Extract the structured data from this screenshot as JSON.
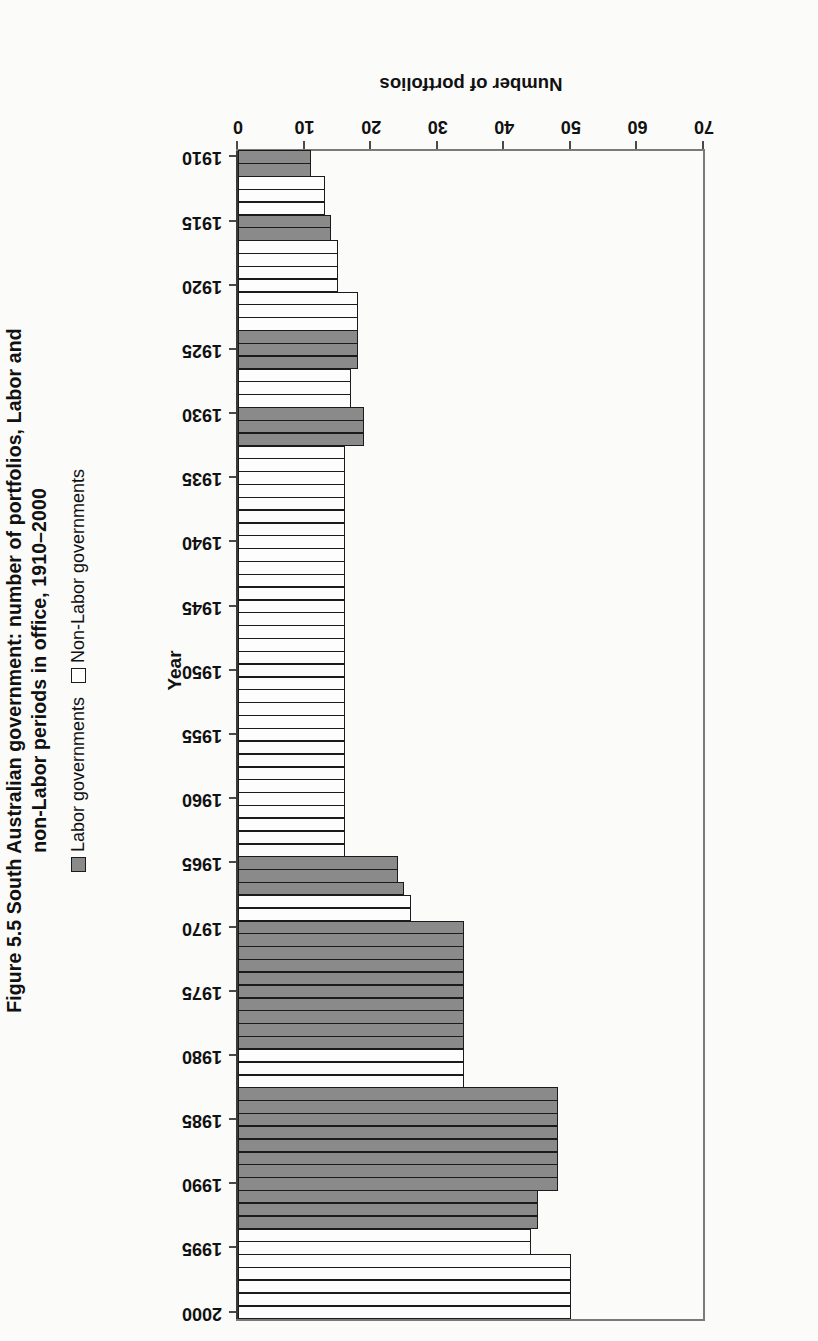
{
  "figure": {
    "title_line1": "Figure 5.5  South Australian government: number of portfolios, Labor and",
    "title_line2": "non-Labor periods in office, 1910–2000",
    "title_full": "Figure 5.5  South Australian government: number of portfolios, Labor and\nnon-Labor periods in office, 1910–2000"
  },
  "legend": {
    "position": "bottom",
    "items": [
      {
        "label": "Labor governments",
        "color": "#8a8a8a",
        "key": "labor"
      },
      {
        "label": "Non-Labor governments",
        "color": "#ffffff",
        "key": "nonlabor"
      }
    ]
  },
  "axes": {
    "category_title": "Year",
    "value_title": "Number of portfolios",
    "value_ticks": [
      "0",
      "10",
      "20",
      "30",
      "40",
      "50",
      "60",
      "70"
    ],
    "category_ticks": [
      "1910",
      "1915",
      "1920",
      "1925",
      "1930",
      "1935",
      "1940",
      "1945",
      "1950",
      "1955",
      "1960",
      "1965",
      "1970",
      "1975",
      "1980",
      "1985",
      "1990",
      "1995",
      "2000"
    ]
  },
  "chart_data": {
    "type": "bar",
    "orientation": "horizontal",
    "xlabel": "Number of portfolios",
    "ylabel": "Year",
    "xlim": [
      0,
      70
    ],
    "xticks": [
      0,
      10,
      20,
      30,
      40,
      50,
      60,
      70
    ],
    "grid": false,
    "legend_position": "bottom",
    "series": [
      {
        "name": "Labor governments",
        "color": "#8a8a8a"
      },
      {
        "name": "Non-Labor governments",
        "color": "#ffffff"
      }
    ],
    "categories": [
      1910,
      1911,
      1912,
      1913,
      1914,
      1915,
      1916,
      1917,
      1918,
      1919,
      1920,
      1921,
      1922,
      1923,
      1924,
      1925,
      1926,
      1927,
      1928,
      1929,
      1930,
      1931,
      1932,
      1933,
      1934,
      1935,
      1936,
      1937,
      1938,
      1939,
      1940,
      1941,
      1942,
      1943,
      1944,
      1945,
      1946,
      1947,
      1948,
      1949,
      1950,
      1951,
      1952,
      1953,
      1954,
      1955,
      1956,
      1957,
      1958,
      1959,
      1960,
      1961,
      1962,
      1963,
      1964,
      1965,
      1966,
      1967,
      1968,
      1969,
      1970,
      1971,
      1972,
      1973,
      1974,
      1975,
      1976,
      1977,
      1978,
      1979,
      1980,
      1981,
      1982,
      1983,
      1984,
      1985,
      1986,
      1987,
      1988,
      1989,
      1990,
      1991,
      1992,
      1993,
      1994,
      1995,
      1996,
      1997,
      1998,
      1999,
      2000
    ],
    "points": [
      {
        "year": 1910,
        "value": 11,
        "party": "labor"
      },
      {
        "year": 1911,
        "value": 11,
        "party": "labor"
      },
      {
        "year": 1912,
        "value": 13,
        "party": "nonlabor"
      },
      {
        "year": 1913,
        "value": 13,
        "party": "nonlabor"
      },
      {
        "year": 1914,
        "value": 13,
        "party": "nonlabor"
      },
      {
        "year": 1915,
        "value": 14,
        "party": "labor"
      },
      {
        "year": 1916,
        "value": 14,
        "party": "labor"
      },
      {
        "year": 1917,
        "value": 15,
        "party": "nonlabor"
      },
      {
        "year": 1918,
        "value": 15,
        "party": "nonlabor"
      },
      {
        "year": 1919,
        "value": 15,
        "party": "nonlabor"
      },
      {
        "year": 1920,
        "value": 15,
        "party": "nonlabor"
      },
      {
        "year": 1921,
        "value": 18,
        "party": "nonlabor"
      },
      {
        "year": 1922,
        "value": 18,
        "party": "nonlabor"
      },
      {
        "year": 1923,
        "value": 18,
        "party": "nonlabor"
      },
      {
        "year": 1924,
        "value": 18,
        "party": "labor"
      },
      {
        "year": 1925,
        "value": 18,
        "party": "labor"
      },
      {
        "year": 1926,
        "value": 18,
        "party": "labor"
      },
      {
        "year": 1927,
        "value": 17,
        "party": "nonlabor"
      },
      {
        "year": 1928,
        "value": 17,
        "party": "nonlabor"
      },
      {
        "year": 1929,
        "value": 17,
        "party": "nonlabor"
      },
      {
        "year": 1930,
        "value": 19,
        "party": "labor"
      },
      {
        "year": 1931,
        "value": 19,
        "party": "labor"
      },
      {
        "year": 1932,
        "value": 19,
        "party": "labor"
      },
      {
        "year": 1933,
        "value": 16,
        "party": "nonlabor"
      },
      {
        "year": 1934,
        "value": 16,
        "party": "nonlabor"
      },
      {
        "year": 1935,
        "value": 16,
        "party": "nonlabor"
      },
      {
        "year": 1936,
        "value": 16,
        "party": "nonlabor"
      },
      {
        "year": 1937,
        "value": 16,
        "party": "nonlabor"
      },
      {
        "year": 1938,
        "value": 16,
        "party": "nonlabor"
      },
      {
        "year": 1939,
        "value": 16,
        "party": "nonlabor"
      },
      {
        "year": 1940,
        "value": 16,
        "party": "nonlabor"
      },
      {
        "year": 1941,
        "value": 16,
        "party": "nonlabor"
      },
      {
        "year": 1942,
        "value": 16,
        "party": "nonlabor"
      },
      {
        "year": 1943,
        "value": 16,
        "party": "nonlabor"
      },
      {
        "year": 1944,
        "value": 16,
        "party": "nonlabor"
      },
      {
        "year": 1945,
        "value": 16,
        "party": "nonlabor"
      },
      {
        "year": 1946,
        "value": 16,
        "party": "nonlabor"
      },
      {
        "year": 1947,
        "value": 16,
        "party": "nonlabor"
      },
      {
        "year": 1948,
        "value": 16,
        "party": "nonlabor"
      },
      {
        "year": 1949,
        "value": 16,
        "party": "nonlabor"
      },
      {
        "year": 1950,
        "value": 16,
        "party": "nonlabor"
      },
      {
        "year": 1951,
        "value": 16,
        "party": "nonlabor"
      },
      {
        "year": 1952,
        "value": 16,
        "party": "nonlabor"
      },
      {
        "year": 1953,
        "value": 16,
        "party": "nonlabor"
      },
      {
        "year": 1954,
        "value": 16,
        "party": "nonlabor"
      },
      {
        "year": 1955,
        "value": 16,
        "party": "nonlabor"
      },
      {
        "year": 1956,
        "value": 16,
        "party": "nonlabor"
      },
      {
        "year": 1957,
        "value": 16,
        "party": "nonlabor"
      },
      {
        "year": 1958,
        "value": 16,
        "party": "nonlabor"
      },
      {
        "year": 1959,
        "value": 16,
        "party": "nonlabor"
      },
      {
        "year": 1960,
        "value": 16,
        "party": "nonlabor"
      },
      {
        "year": 1961,
        "value": 16,
        "party": "nonlabor"
      },
      {
        "year": 1962,
        "value": 16,
        "party": "nonlabor"
      },
      {
        "year": 1963,
        "value": 16,
        "party": "nonlabor"
      },
      {
        "year": 1964,
        "value": 16,
        "party": "nonlabor"
      },
      {
        "year": 1965,
        "value": 24,
        "party": "labor"
      },
      {
        "year": 1966,
        "value": 24,
        "party": "labor"
      },
      {
        "year": 1967,
        "value": 25,
        "party": "labor"
      },
      {
        "year": 1968,
        "value": 26,
        "party": "nonlabor"
      },
      {
        "year": 1969,
        "value": 26,
        "party": "nonlabor"
      },
      {
        "year": 1970,
        "value": 34,
        "party": "labor"
      },
      {
        "year": 1971,
        "value": 34,
        "party": "labor"
      },
      {
        "year": 1972,
        "value": 34,
        "party": "labor"
      },
      {
        "year": 1973,
        "value": 34,
        "party": "labor"
      },
      {
        "year": 1974,
        "value": 34,
        "party": "labor"
      },
      {
        "year": 1975,
        "value": 34,
        "party": "labor"
      },
      {
        "year": 1976,
        "value": 34,
        "party": "labor"
      },
      {
        "year": 1977,
        "value": 34,
        "party": "labor"
      },
      {
        "year": 1978,
        "value": 34,
        "party": "labor"
      },
      {
        "year": 1979,
        "value": 34,
        "party": "labor"
      },
      {
        "year": 1980,
        "value": 34,
        "party": "nonlabor"
      },
      {
        "year": 1981,
        "value": 34,
        "party": "nonlabor"
      },
      {
        "year": 1982,
        "value": 34,
        "party": "nonlabor"
      },
      {
        "year": 1983,
        "value": 48,
        "party": "labor"
      },
      {
        "year": 1984,
        "value": 48,
        "party": "labor"
      },
      {
        "year": 1985,
        "value": 48,
        "party": "labor"
      },
      {
        "year": 1986,
        "value": 48,
        "party": "labor"
      },
      {
        "year": 1987,
        "value": 48,
        "party": "labor"
      },
      {
        "year": 1988,
        "value": 48,
        "party": "labor"
      },
      {
        "year": 1989,
        "value": 48,
        "party": "labor"
      },
      {
        "year": 1990,
        "value": 48,
        "party": "labor"
      },
      {
        "year": 1991,
        "value": 45,
        "party": "labor"
      },
      {
        "year": 1992,
        "value": 45,
        "party": "labor"
      },
      {
        "year": 1993,
        "value": 45,
        "party": "labor"
      },
      {
        "year": 1994,
        "value": 44,
        "party": "nonlabor"
      },
      {
        "year": 1995,
        "value": 44,
        "party": "nonlabor"
      },
      {
        "year": 1996,
        "value": 50,
        "party": "nonlabor"
      },
      {
        "year": 1997,
        "value": 50,
        "party": "nonlabor"
      },
      {
        "year": 1998,
        "value": 50,
        "party": "nonlabor"
      },
      {
        "year": 1999,
        "value": 50,
        "party": "nonlabor"
      },
      {
        "year": 2000,
        "value": 50,
        "party": "nonlabor"
      }
    ]
  }
}
